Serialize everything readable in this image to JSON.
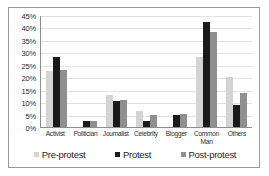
{
  "chart_data": {
    "type": "bar",
    "title": "",
    "xlabel": "",
    "ylabel": "",
    "ylim": [
      0,
      45
    ],
    "ytick_labels": [
      "45%",
      "40%",
      "35%",
      "30%",
      "25%",
      "20%",
      "15%",
      "10%",
      "5%",
      "0%"
    ],
    "ytick_values": [
      45,
      40,
      35,
      30,
      25,
      20,
      15,
      10,
      5,
      0
    ],
    "grid": true,
    "legend_position": "bottom",
    "categories": [
      "Activist",
      "Politician",
      "Journalist",
      "Celebrity",
      "Blogger",
      "Common Man",
      "Others"
    ],
    "series": [
      {
        "name": "Pre-protest",
        "color": "#d4d4d4",
        "values": [
          22.5,
          0,
          13,
          6.5,
          0,
          28,
          20
        ]
      },
      {
        "name": "Protest",
        "color": "#1a1a1a",
        "values": [
          28,
          2.5,
          10.5,
          2.5,
          5,
          42,
          9
        ]
      },
      {
        "name": "Post-protest",
        "color": "#8f8f8f",
        "values": [
          23,
          2.5,
          11,
          5,
          5.3,
          38,
          13.5
        ]
      }
    ]
  },
  "legend": {
    "items": [
      {
        "label": "Pre-protest"
      },
      {
        "label": "Protest"
      },
      {
        "label": "Post-protest"
      }
    ]
  }
}
